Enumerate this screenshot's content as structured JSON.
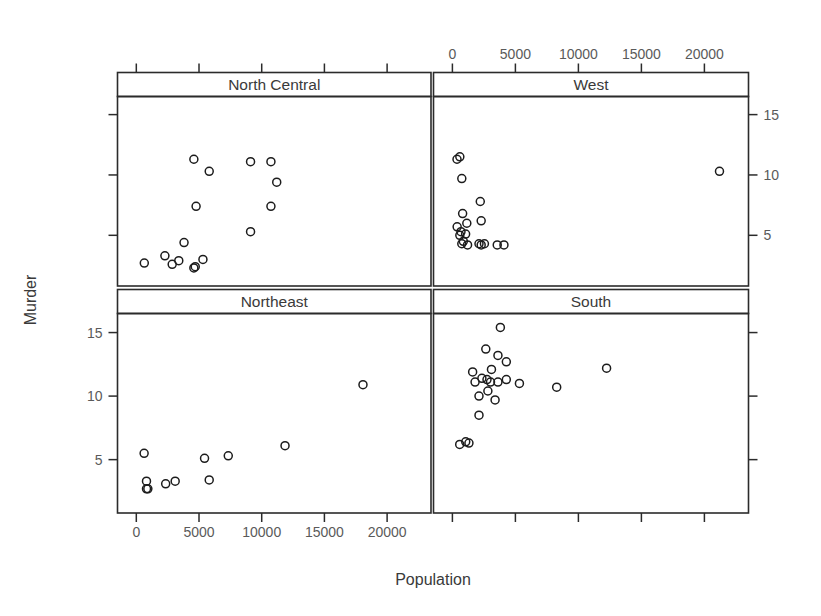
{
  "figure": {
    "width": 821,
    "height": 616,
    "background": "#ffffff",
    "foreground": "#2b2b2b",
    "point_color": "#1c1c1c"
  },
  "axis_titles": {
    "x": "Population",
    "y": "Murder"
  },
  "chart_data": {
    "type": "scatter",
    "title": "",
    "xlabel": "Population",
    "ylabel": "Murder",
    "xlim": [
      -1500,
      23500
    ],
    "ylim": [
      0.8,
      16.5
    ],
    "xticks": [
      0,
      5000,
      10000,
      15000,
      20000
    ],
    "xtick_labels": [
      "0",
      "5000",
      "10000",
      "15000",
      "20000"
    ],
    "yticks": [
      5,
      10,
      15
    ],
    "ytick_labels": [
      "5",
      "10",
      "15"
    ],
    "grid": false,
    "legend": "none",
    "layout": "2x2 conditioned trellis panels",
    "point_symbol": "open-circle",
    "axis_placement": {
      "top_left_panel": "x-axis ticks only (unlabeled)",
      "top_right_panel": "x-axis labels on top, y-axis labels on right",
      "bottom_left_panel": "x-axis labels on bottom, y-axis labels on left",
      "bottom_right_panel": "x-axis ticks only (unlabeled)"
    },
    "panels": [
      {
        "name": "North Central",
        "position": "top-left",
        "points": [
          {
            "x": 4589,
            "y": 2.3
          },
          {
            "x": 4700,
            "y": 2.4
          },
          {
            "x": 2861,
            "y": 2.6
          },
          {
            "x": 637,
            "y": 2.7
          },
          {
            "x": 5313,
            "y": 3.0
          },
          {
            "x": 3387,
            "y": 2.9
          },
          {
            "x": 2280,
            "y": 3.3
          },
          {
            "x": 3806,
            "y": 4.4
          },
          {
            "x": 9111,
            "y": 5.3
          },
          {
            "x": 10735,
            "y": 7.4
          },
          {
            "x": 4767,
            "y": 7.4
          },
          {
            "x": 11197,
            "y": 9.4
          },
          {
            "x": 5814,
            "y": 10.3
          },
          {
            "x": 10735,
            "y": 11.1
          },
          {
            "x": 9111,
            "y": 11.1
          },
          {
            "x": 4589,
            "y": 11.3
          }
        ]
      },
      {
        "name": "West",
        "position": "top-right",
        "points": [
          {
            "x": 365,
            "y": 11.3
          },
          {
            "x": 590,
            "y": 11.5
          },
          {
            "x": 746,
            "y": 9.7
          },
          {
            "x": 2212,
            "y": 7.8
          },
          {
            "x": 21198,
            "y": 10.3
          },
          {
            "x": 812,
            "y": 6.8
          },
          {
            "x": 2284,
            "y": 6.2
          },
          {
            "x": 1144,
            "y": 6.0
          },
          {
            "x": 681,
            "y": 5.3
          },
          {
            "x": 590,
            "y": 5.0
          },
          {
            "x": 746,
            "y": 4.3
          },
          {
            "x": 1203,
            "y": 4.2
          },
          {
            "x": 2284,
            "y": 4.2
          },
          {
            "x": 3559,
            "y": 4.2
          },
          {
            "x": 376,
            "y": 5.7
          },
          {
            "x": 868,
            "y": 4.5
          },
          {
            "x": 2110,
            "y": 4.3
          },
          {
            "x": 4091,
            "y": 4.2
          },
          {
            "x": 1049,
            "y": 5.1
          },
          {
            "x": 2541,
            "y": 4.3
          }
        ]
      },
      {
        "name": "Northeast",
        "position": "bottom-left",
        "points": [
          {
            "x": 623,
            "y": 5.5
          },
          {
            "x": 812,
            "y": 3.3
          },
          {
            "x": 812,
            "y": 2.7
          },
          {
            "x": 920,
            "y": 2.7
          },
          {
            "x": 2341,
            "y": 3.1
          },
          {
            "x": 3100,
            "y": 3.3
          },
          {
            "x": 5814,
            "y": 3.4
          },
          {
            "x": 5441,
            "y": 5.1
          },
          {
            "x": 7333,
            "y": 5.3
          },
          {
            "x": 11860,
            "y": 6.1
          },
          {
            "x": 18076,
            "y": 10.9
          }
        ]
      },
      {
        "name": "South",
        "position": "bottom-right",
        "points": [
          {
            "x": 579,
            "y": 6.2
          },
          {
            "x": 1058,
            "y": 6.4
          },
          {
            "x": 1313,
            "y": 6.3
          },
          {
            "x": 2110,
            "y": 8.5
          },
          {
            "x": 1799,
            "y": 11.1
          },
          {
            "x": 3615,
            "y": 13.2
          },
          {
            "x": 4281,
            "y": 12.7
          },
          {
            "x": 3806,
            "y": 15.4
          },
          {
            "x": 2341,
            "y": 11.4
          },
          {
            "x": 2816,
            "y": 10.4
          },
          {
            "x": 3024,
            "y": 11.1
          },
          {
            "x": 3615,
            "y": 11.1
          },
          {
            "x": 4281,
            "y": 11.3
          },
          {
            "x": 5319,
            "y": 11.0
          },
          {
            "x": 3387,
            "y": 9.7
          },
          {
            "x": 2745,
            "y": 11.3
          },
          {
            "x": 8277,
            "y": 10.7
          },
          {
            "x": 12237,
            "y": 12.2
          },
          {
            "x": 3100,
            "y": 12.1
          },
          {
            "x": 2110,
            "y": 10.0
          },
          {
            "x": 1606,
            "y": 11.9
          },
          {
            "x": 2651,
            "y": 13.7
          }
        ]
      }
    ]
  }
}
